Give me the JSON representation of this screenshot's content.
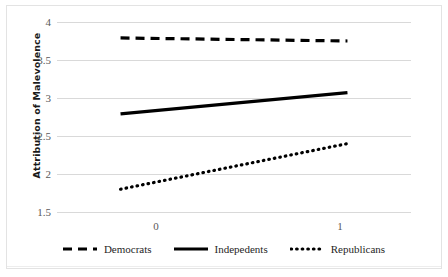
{
  "chart_data": {
    "type": "line",
    "title": "",
    "xlabel": "",
    "ylabel": "Attribution of Malevolence",
    "x": [
      0,
      1
    ],
    "xtick_labels": [
      "0",
      "1"
    ],
    "xlim": [
      -0.28,
      1.28
    ],
    "ylim": [
      1.5,
      4.0
    ],
    "ytick_labels": [
      "1.5",
      "2",
      "2.5",
      "3",
      "3.5",
      "4"
    ],
    "ytick_values": [
      1.5,
      2,
      2.5,
      3,
      3.5,
      4
    ],
    "grid": "horizontal",
    "legend_position": "bottom",
    "series": [
      {
        "name": "Democrats",
        "style": "dashed",
        "color": "#000000",
        "values": [
          3.79,
          3.75
        ]
      },
      {
        "name": "Indepedents",
        "style": "solid",
        "color": "#000000",
        "values": [
          2.79,
          3.07
        ]
      },
      {
        "name": "Republicans",
        "style": "dotted",
        "color": "#000000",
        "values": [
          1.8,
          2.4
        ]
      }
    ]
  },
  "axes": {
    "y_title": "Attribution of Malevolence",
    "y_ticks": [
      {
        "label": "4"
      },
      {
        "label": "3.5"
      },
      {
        "label": "3"
      },
      {
        "label": "2.5"
      },
      {
        "label": "2"
      },
      {
        "label": "1.5"
      }
    ],
    "x_ticks": [
      {
        "label": "0"
      },
      {
        "label": "1"
      }
    ]
  },
  "legend": {
    "items": [
      {
        "label": "Democrats",
        "style": "dashed"
      },
      {
        "label": "Indepedents",
        "style": "solid"
      },
      {
        "label": "Republicans",
        "style": "dotted"
      }
    ]
  }
}
